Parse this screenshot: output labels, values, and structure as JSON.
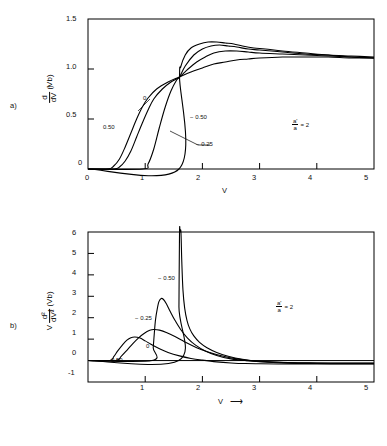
{
  "figure": {
    "background": "#ffffff",
    "line_color": "#000000"
  },
  "panels": [
    {
      "letter": "a)",
      "annotation_num": "a'",
      "annotation_den": "a",
      "annotation_eq": "= 2",
      "ylabel_num": "d",
      "ylabel_den": "dV",
      "ylabel_paren": "(Vb)",
      "ylabel_arrow": "↑",
      "xlabel": "V",
      "xlabel_arrow": "",
      "yticks": [
        "0",
        "0.5",
        "1.0",
        "1.5"
      ],
      "xticks": [
        "0",
        "1",
        "2",
        "3",
        "4",
        "5"
      ],
      "curve_labels": [
        "0",
        "0.50",
        "− 0.50",
        "− 0.25"
      ]
    },
    {
      "letter": "b)",
      "annotation_num": "a'",
      "annotation_den": "a",
      "annotation_eq": "= 2",
      "ylabel_pre": "V",
      "ylabel_num": "d²",
      "ylabel_den": "dV²",
      "ylabel_paren": "(Vb)",
      "ylabel_arrow": "↑",
      "xlabel": "V",
      "xlabel_arrow": "⟶",
      "yticks": [
        "-1",
        "0",
        "1",
        "2",
        "3",
        "4",
        "5",
        "6"
      ],
      "xticks": [
        "1",
        "2",
        "3",
        "4",
        "5"
      ],
      "curve_labels": [
        "− 0.50",
        "− 0.25",
        "0",
        "0.50"
      ]
    }
  ],
  "chart_data": [
    {
      "type": "line",
      "panel": "a",
      "title": "",
      "xlabel": "V",
      "ylabel": "d/dV (Vb)",
      "xlim": [
        0,
        5
      ],
      "ylim": [
        0,
        1.5
      ],
      "xticks": [
        0,
        1,
        2,
        3,
        4,
        5
      ],
      "yticks": [
        0,
        0.5,
        1.0,
        1.5
      ],
      "grid": false,
      "legend": "inline-curve-labels",
      "annotation": "a'/a = 2",
      "crossing_point": [
        1.6,
        0.92
      ],
      "series": [
        {
          "name": "0.50",
          "x": [
            0.0,
            0.35,
            0.45,
            0.55,
            0.65,
            0.75,
            0.85,
            0.95,
            1.05,
            1.2,
            1.4,
            1.6,
            1.8,
            2.0,
            2.2,
            2.4,
            2.6,
            2.8,
            3.0,
            3.4,
            3.8,
            4.2,
            4.6,
            5.0
          ],
          "y": [
            0.0,
            0.0,
            0.03,
            0.1,
            0.22,
            0.36,
            0.5,
            0.62,
            0.71,
            0.8,
            0.87,
            0.92,
            0.97,
            1.01,
            1.05,
            1.07,
            1.09,
            1.1,
            1.11,
            1.12,
            1.12,
            1.12,
            1.11,
            1.11
          ]
        },
        {
          "name": "0",
          "x": [
            0.0,
            0.45,
            0.55,
            0.65,
            0.75,
            0.85,
            0.95,
            1.05,
            1.15,
            1.3,
            1.45,
            1.6,
            1.75,
            1.9,
            2.05,
            2.2,
            2.4,
            2.6,
            2.8,
            3.0,
            3.4,
            3.8,
            4.2,
            4.6,
            5.0
          ],
          "y": [
            0.0,
            0.0,
            0.02,
            0.08,
            0.18,
            0.32,
            0.46,
            0.59,
            0.7,
            0.8,
            0.87,
            0.92,
            1.0,
            1.07,
            1.12,
            1.16,
            1.18,
            1.18,
            1.17,
            1.16,
            1.15,
            1.14,
            1.13,
            1.12,
            1.11
          ]
        },
        {
          "name": "-0.25",
          "x": [
            0.0,
            0.95,
            1.05,
            1.15,
            1.25,
            1.35,
            1.45,
            1.55,
            1.6,
            1.7,
            1.85,
            2.0,
            2.15,
            2.3,
            2.45,
            2.6,
            2.8,
            3.0,
            3.4,
            3.8,
            4.2,
            4.6,
            5.0
          ],
          "y": [
            0.0,
            0.0,
            0.05,
            0.2,
            0.42,
            0.62,
            0.78,
            0.89,
            0.92,
            1.03,
            1.14,
            1.2,
            1.23,
            1.24,
            1.23,
            1.22,
            1.2,
            1.19,
            1.17,
            1.15,
            1.14,
            1.12,
            1.11
          ]
        },
        {
          "name": "-0.50",
          "x": [
            0.0,
            1.59,
            1.6,
            1.62,
            1.7,
            1.8,
            1.95,
            2.1,
            2.25,
            2.4,
            2.55,
            2.7,
            2.9,
            3.1,
            3.4,
            3.8,
            4.2,
            4.6,
            5.0
          ],
          "y": [
            0.0,
            0.0,
            0.92,
            1.02,
            1.14,
            1.21,
            1.25,
            1.27,
            1.27,
            1.26,
            1.25,
            1.23,
            1.21,
            1.2,
            1.18,
            1.16,
            1.14,
            1.13,
            1.12
          ]
        }
      ]
    },
    {
      "type": "line",
      "panel": "b",
      "title": "",
      "xlabel": "V",
      "ylabel": "V d²/dV² (Vb)",
      "xlim": [
        0,
        5
      ],
      "ylim": [
        -1,
        6
      ],
      "xticks": [
        1,
        2,
        3,
        4,
        5
      ],
      "yticks": [
        -1,
        0,
        1,
        2,
        3,
        4,
        5,
        6
      ],
      "grid": false,
      "legend": "inline-curve-labels",
      "annotation": "a'/a = 2",
      "series": [
        {
          "name": "0.50",
          "peak_x": 0.8,
          "peak_y": 1.1,
          "x": [
            0.0,
            0.38,
            0.45,
            0.52,
            0.6,
            0.68,
            0.75,
            0.82,
            0.9,
            1.0,
            1.1,
            1.25,
            1.4,
            1.6,
            1.8,
            2.0,
            2.25,
            2.5,
            2.75,
            3.0,
            3.5,
            4.0,
            4.5,
            5.0
          ],
          "y": [
            0.0,
            0.0,
            0.18,
            0.45,
            0.72,
            0.95,
            1.07,
            1.1,
            1.06,
            0.92,
            0.76,
            0.55,
            0.38,
            0.22,
            0.1,
            0.02,
            -0.06,
            -0.11,
            -0.14,
            -0.15,
            -0.16,
            -0.16,
            -0.16,
            -0.16
          ]
        },
        {
          "name": "0",
          "peak_x": 1.15,
          "peak_y": 1.45,
          "x": [
            0.0,
            0.48,
            0.58,
            0.68,
            0.78,
            0.88,
            0.98,
            1.08,
            1.15,
            1.25,
            1.38,
            1.52,
            1.7,
            1.9,
            2.1,
            2.35,
            2.6,
            2.85,
            3.1,
            3.5,
            4.0,
            4.5,
            5.0
          ],
          "y": [
            0.0,
            0.0,
            0.2,
            0.48,
            0.78,
            1.05,
            1.26,
            1.41,
            1.45,
            1.42,
            1.3,
            1.12,
            0.86,
            0.6,
            0.4,
            0.21,
            0.08,
            -0.01,
            -0.07,
            -0.12,
            -0.14,
            -0.15,
            -0.15
          ]
        },
        {
          "name": "-0.25",
          "peak_x": 1.28,
          "peak_y": 2.9,
          "x": [
            0.0,
            1.12,
            1.14,
            1.16,
            1.18,
            1.21,
            1.24,
            1.28,
            1.32,
            1.37,
            1.44,
            1.52,
            1.62,
            1.74,
            1.88,
            2.05,
            2.25,
            2.5,
            2.75,
            3.0,
            3.5,
            4.0,
            4.5,
            5.0
          ],
          "y": [
            0.0,
            0.0,
            0.6,
            1.3,
            1.9,
            2.4,
            2.75,
            2.9,
            2.85,
            2.65,
            2.28,
            1.88,
            1.45,
            1.05,
            0.72,
            0.45,
            0.24,
            0.08,
            0.0,
            -0.05,
            -0.1,
            -0.12,
            -0.13,
            -0.13
          ]
        },
        {
          "name": "-0.50",
          "peak_x": 1.62,
          "peak_y": 6.0,
          "x": [
            0.0,
            1.585,
            1.59,
            1.6,
            1.61,
            1.625,
            1.64,
            1.66,
            1.69,
            1.73,
            1.78,
            1.85,
            1.95,
            2.08,
            2.25,
            2.45,
            2.7,
            3.0,
            3.5,
            4.0,
            4.5,
            5.0
          ],
          "y": [
            0.0,
            0.0,
            2.5,
            6.0,
            6.0,
            6.0,
            4.6,
            3.3,
            2.45,
            1.88,
            1.48,
            1.15,
            0.85,
            0.6,
            0.38,
            0.2,
            0.06,
            -0.03,
            -0.09,
            -0.11,
            -0.12,
            -0.12
          ]
        }
      ]
    }
  ]
}
